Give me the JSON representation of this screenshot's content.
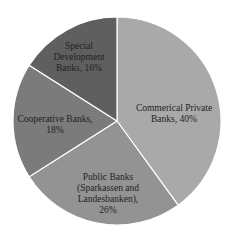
{
  "chart_data": {
    "type": "pie",
    "title": "",
    "start_angle_deg": 0,
    "direction": "clockwise",
    "center": [
      117,
      121
    ],
    "radius": 104,
    "categories": [
      "Commerical Private Banks",
      "Public Banks (Sparkassen and Landesbanken)",
      "Cooperative Banks",
      "Special Development Banks"
    ],
    "values": [
      40,
      26,
      18,
      16
    ],
    "unit": "%",
    "colors": [
      "#a9a9a9",
      "#939393",
      "#7b7b7b",
      "#5f5f5f"
    ],
    "labels": [
      {
        "lines": [
          "Commerical Private",
          "Banks, 40%"
        ],
        "x": 174,
        "y": 111
      },
      {
        "lines": [
          "Public Banks",
          "(Sparkassen and",
          "Landesbanken),",
          "26%"
        ],
        "x": 108,
        "y": 180
      },
      {
        "lines": [
          "Cooperative Banks,",
          "18%"
        ],
        "x": 55,
        "y": 122
      },
      {
        "lines": [
          "Special",
          "Development",
          "Banks, 16%"
        ],
        "x": 79,
        "y": 49
      }
    ],
    "legend": "none"
  }
}
